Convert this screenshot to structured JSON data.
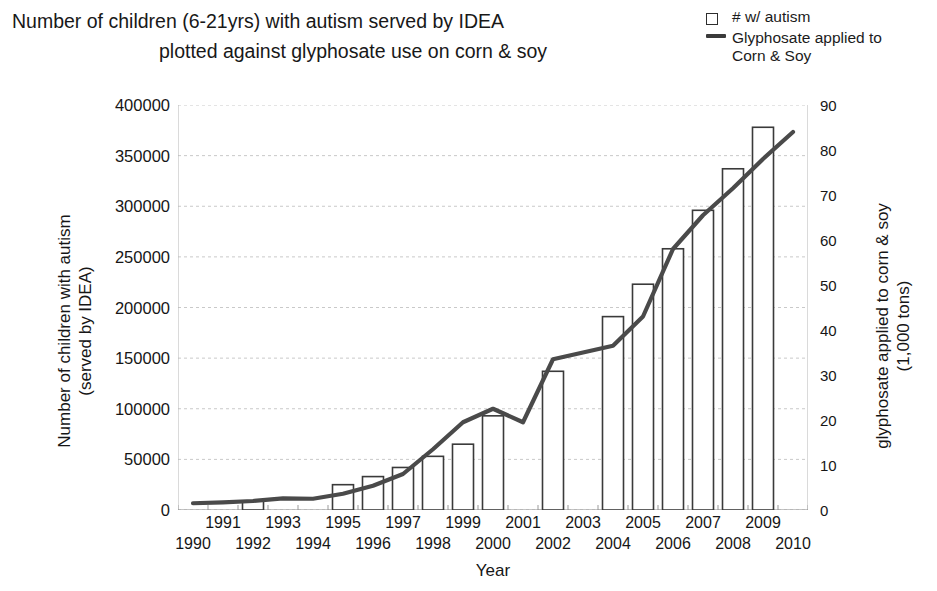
{
  "title": {
    "line1": "Number of children (6-21yrs) with autism served by IDEA",
    "line2": "plotted against glyphosate use on corn & soy"
  },
  "legend": {
    "position": "top-right",
    "items": [
      {
        "marker": "open-square",
        "label": "# w/ autism"
      },
      {
        "marker": "line",
        "label": "Glyphosate applied to\nCorn & Soy"
      }
    ]
  },
  "axes": {
    "y_left_label": "Number of children with autism\n(served by IDEA)",
    "y_right_label": "glyphosate applied to corn & soy\n(1,000 tons)",
    "x_label": "Year"
  },
  "chart_data": {
    "type": "bar",
    "title": "Number of children (6-21yrs) with autism served by IDEA plotted against glyphosate use on corn & soy",
    "xlabel": "Year",
    "ylabel": "Number of children with autism (served by IDEA)",
    "y2label": "glyphosate applied to corn & soy (1,000 tons)",
    "categories": [
      1990,
      1991,
      1992,
      1993,
      1994,
      1995,
      1996,
      1997,
      1998,
      1999,
      2000,
      2001,
      2002,
      2003,
      2004,
      2005,
      2006,
      2007,
      2008,
      2009,
      2010
    ],
    "ylim": [
      0,
      400000
    ],
    "yticks": [
      0,
      50000,
      100000,
      150000,
      200000,
      250000,
      300000,
      350000,
      400000
    ],
    "y2lim": [
      0,
      90
    ],
    "y2ticks": [
      0,
      10,
      20,
      30,
      40,
      50,
      60,
      70,
      80,
      90
    ],
    "grid": true,
    "series": [
      {
        "name": "# w/ autism",
        "type": "bar",
        "axis": "left",
        "color": "#3a3a3a",
        "fill": "#ffffff",
        "values": [
          null,
          null,
          9000,
          null,
          null,
          25000,
          33000,
          42000,
          53000,
          65000,
          93000,
          null,
          137000,
          null,
          191000,
          223000,
          258000,
          296000,
          337000,
          378000,
          null
        ]
      },
      {
        "name": "Glyphosate applied to Corn & Soy",
        "type": "line",
        "axis": "right",
        "color": "#4a4a4a",
        "values": [
          1.5,
          1.7,
          2.0,
          2.6,
          2.5,
          3.6,
          5.4,
          8.0,
          13.5,
          19.5,
          22.5,
          19.5,
          33.5,
          35.0,
          36.5,
          43.0,
          58.0,
          65.5,
          71.5,
          78.0,
          84.0
        ]
      }
    ]
  }
}
